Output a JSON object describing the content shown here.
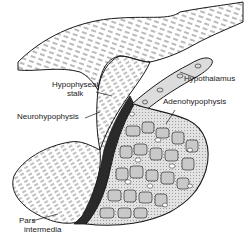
{
  "figure": {
    "style": "black ink line drawing",
    "colors": {
      "ink": "#1a1a1a",
      "pars_intermedia_fill": "#2a2a2a",
      "cell_fill": "#d6d6d6",
      "background": "#ffffff"
    }
  },
  "labels": {
    "hypophyseal_stalk_line1": "Hypophyseal",
    "hypophyseal_stalk_line2": "stalk",
    "hypothalamus": "Hypothalamus",
    "neurohypophysis": "Neurohypophysis",
    "adenohypophysis": "Adenohypophysis",
    "pars_intermedia_line1": "Pars",
    "pars_intermedia_line2": "intermedia"
  }
}
